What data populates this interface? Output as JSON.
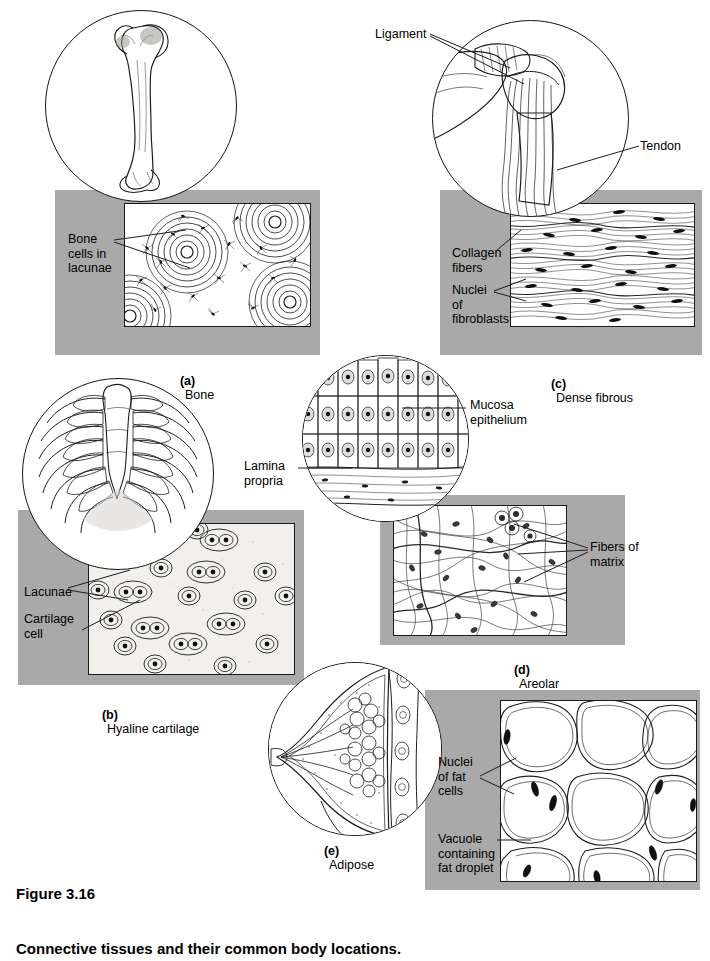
{
  "figure": {
    "number": "Figure 3.16",
    "caption": "Connective tissues and their common body locations."
  },
  "colors": {
    "panel_gray": "#a9a9a9",
    "ink": "#000000",
    "background": "#ffffff"
  },
  "panels": [
    {
      "id": "a",
      "caption_letter": "(a)",
      "caption_text": "Bone",
      "organ_icon": "femur-bone-icon",
      "micrograph": "compact-bone-osteon-micrograph",
      "labels": [
        {
          "name": "bone-cells-in-lacunae",
          "text": "Bone\ncells in\nlacunae"
        }
      ]
    },
    {
      "id": "b",
      "caption_letter": "(b)",
      "caption_text": "Hyaline cartilage",
      "organ_icon": "rib-cage-icon",
      "micrograph": "hyaline-cartilage-micrograph",
      "labels": [
        {
          "name": "lacunae",
          "text": "Lacunae"
        },
        {
          "name": "cartilage-cell",
          "text": "Cartilage\ncell"
        }
      ]
    },
    {
      "id": "c",
      "caption_letter": "(c)",
      "caption_text": "Dense fibrous",
      "organ_icon": "shoulder-joint-icon",
      "micrograph": "dense-fibrous-tissue-micrograph",
      "labels": [
        {
          "name": "ligament",
          "text": "Ligament"
        },
        {
          "name": "tendon",
          "text": "Tendon"
        },
        {
          "name": "collagen-fibers",
          "text": "Collagen\nfibers"
        },
        {
          "name": "nuclei-of-fibroblasts",
          "text": "Nuclei\nof\nfibroblasts"
        }
      ]
    },
    {
      "id": "d",
      "caption_letter": "(d)",
      "caption_text": "Areolar",
      "organ_icon": "mucosa-lamina-propria-icon",
      "micrograph": "areolar-tissue-micrograph",
      "labels": [
        {
          "name": "mucosa-epithelium",
          "text": "Mucosa\nepithelium"
        },
        {
          "name": "lamina-propria",
          "text": "Lamina\npropria"
        },
        {
          "name": "fibers-of-matrix",
          "text": "Fibers of\nmatrix"
        }
      ]
    },
    {
      "id": "e",
      "caption_letter": "(e)",
      "caption_text": "Adipose",
      "organ_icon": "breast-cross-section-icon",
      "micrograph": "adipose-tissue-micrograph",
      "labels": [
        {
          "name": "nuclei-of-fat-cells",
          "text": "Nuclei\nof fat\ncells"
        },
        {
          "name": "vacuole-containing-fat-droplet",
          "text": "Vacuole\ncontaining\nfat droplet"
        }
      ]
    }
  ]
}
